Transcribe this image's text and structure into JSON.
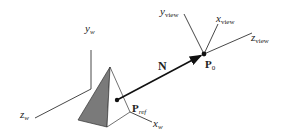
{
  "diagram": {
    "labels": {
      "y_w": {
        "main": "y",
        "sub": "w"
      },
      "z_w": {
        "main": "z",
        "sub": "w"
      },
      "x_w": {
        "main": "x",
        "sub": "w"
      },
      "y_view": {
        "main": "y",
        "sub": "view"
      },
      "x_view": {
        "main": "x",
        "sub": "view"
      },
      "z_view": {
        "main": "z",
        "sub": "view"
      },
      "N": "N",
      "P_ref": {
        "main": "P",
        "sub": "ref"
      },
      "P0": {
        "main": "P",
        "sub": "0"
      }
    },
    "colors": {
      "line": "#333333",
      "pyramid_shaded": "#7a7a7a",
      "pyramid_face": "#ffffff",
      "background": "#ffffff"
    }
  }
}
